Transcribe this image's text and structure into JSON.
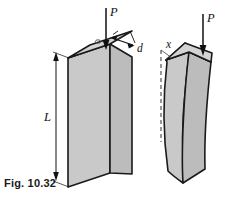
{
  "figure": {
    "caption": "Fig. 10.32",
    "colors": {
      "background": "#ffffff",
      "face_front": "#c9c9c9",
      "face_side": "#bdbdbd",
      "face_top": "#d2d2d2",
      "outline": "#1a1a1a",
      "leader": "#1a1a1a",
      "dashed": "#555555",
      "caption_text": "#1a1a1a"
    },
    "left_column": {
      "name": "straight-column",
      "load_label": "P",
      "length_label": "L",
      "eccentricity_label": "d",
      "centroid_mark": "o"
    },
    "right_column": {
      "name": "buckled-column",
      "load_label": "P",
      "deflection_axis_label": "x"
    }
  }
}
